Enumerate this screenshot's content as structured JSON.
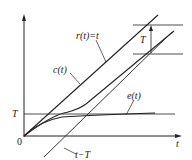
{
  "diagram": {
    "title": "",
    "axes": {
      "x_label": "t",
      "y_label": "",
      "origin_label": "0"
    },
    "curves": [
      {
        "id": "r",
        "label": "r(t)=t"
      },
      {
        "id": "c",
        "label": "c(t)"
      },
      {
        "id": "e",
        "label": "e(t)"
      },
      {
        "id": "shift",
        "label": "t−T"
      }
    ],
    "levels": {
      "T_label": "T",
      "T_gap_label": "T"
    }
  }
}
